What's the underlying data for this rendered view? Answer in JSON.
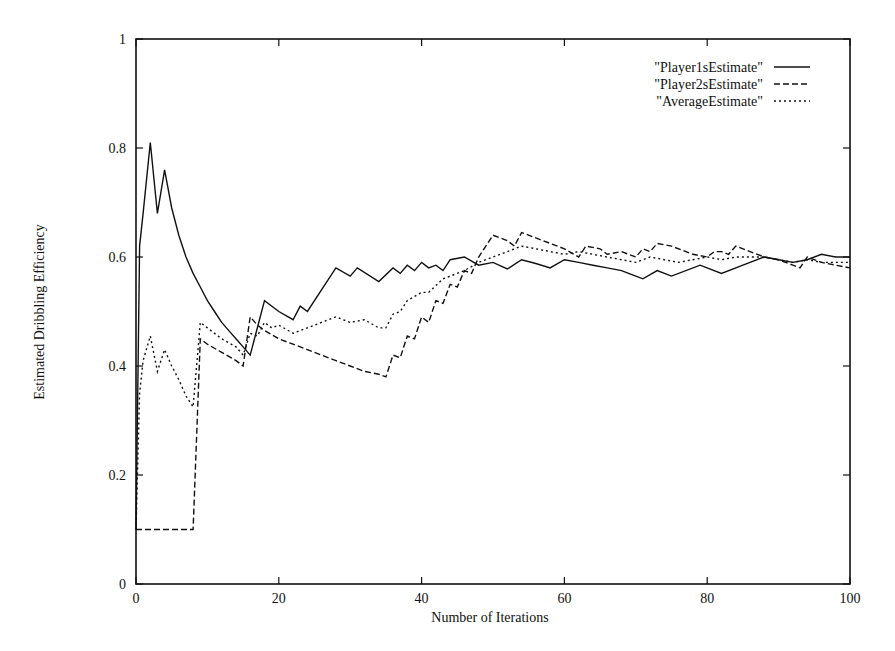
{
  "chart_data": {
    "type": "line",
    "title": "",
    "xlabel": "Number of Iterations",
    "ylabel": "Estimated Dribbling Efficiency",
    "xlim": [
      0,
      100
    ],
    "ylim": [
      0,
      1
    ],
    "xticks": [
      0,
      20,
      40,
      60,
      80,
      100
    ],
    "yticks": [
      0,
      0.2,
      0.4,
      0.6,
      0.8,
      1
    ],
    "xtick_labels": [
      "0",
      "20",
      "40",
      "60",
      "80",
      "100"
    ],
    "ytick_labels": [
      "0",
      "0.2",
      "0.4",
      "0.6",
      "0.8",
      "1"
    ],
    "grid": false,
    "legend_position": "top-right",
    "series": [
      {
        "name": "\"Player1sEstimate\"",
        "style": "solid",
        "points": [
          [
            0,
            0.1
          ],
          [
            0.5,
            0.62
          ],
          [
            1,
            0.68
          ],
          [
            2,
            0.81
          ],
          [
            3,
            0.68
          ],
          [
            4,
            0.76
          ],
          [
            5,
            0.69
          ],
          [
            6,
            0.64
          ],
          [
            7,
            0.6
          ],
          [
            8,
            0.57
          ],
          [
            9,
            0.545
          ],
          [
            10,
            0.52
          ],
          [
            11,
            0.5
          ],
          [
            12,
            0.48
          ],
          [
            13,
            0.465
          ],
          [
            14,
            0.45
          ],
          [
            15,
            0.435
          ],
          [
            16,
            0.42
          ],
          [
            18,
            0.52
          ],
          [
            20,
            0.5
          ],
          [
            22,
            0.485
          ],
          [
            23,
            0.51
          ],
          [
            24,
            0.5
          ],
          [
            28,
            0.58
          ],
          [
            30,
            0.565
          ],
          [
            31,
            0.58
          ],
          [
            34,
            0.555
          ],
          [
            36,
            0.58
          ],
          [
            37,
            0.57
          ],
          [
            38,
            0.585
          ],
          [
            39,
            0.575
          ],
          [
            40,
            0.59
          ],
          [
            41,
            0.58
          ],
          [
            42,
            0.585
          ],
          [
            43,
            0.575
          ],
          [
            44,
            0.595
          ],
          [
            46,
            0.6
          ],
          [
            48,
            0.585
          ],
          [
            50,
            0.59
          ],
          [
            52,
            0.578
          ],
          [
            54,
            0.595
          ],
          [
            56,
            0.588
          ],
          [
            58,
            0.58
          ],
          [
            60,
            0.595
          ],
          [
            62,
            0.59
          ],
          [
            64,
            0.585
          ],
          [
            66,
            0.58
          ],
          [
            68,
            0.575
          ],
          [
            70,
            0.565
          ],
          [
            71,
            0.56
          ],
          [
            73,
            0.575
          ],
          [
            75,
            0.565
          ],
          [
            79,
            0.585
          ],
          [
            82,
            0.57
          ],
          [
            85,
            0.585
          ],
          [
            88,
            0.6
          ],
          [
            90,
            0.595
          ],
          [
            92,
            0.59
          ],
          [
            94,
            0.595
          ],
          [
            96,
            0.605
          ],
          [
            98,
            0.6
          ],
          [
            100,
            0.6
          ]
        ]
      },
      {
        "name": "\"Player2sEstimate\"",
        "style": "dashed",
        "points": [
          [
            0,
            0.1
          ],
          [
            8,
            0.1
          ],
          [
            9,
            0.45
          ],
          [
            10,
            0.44
          ],
          [
            12,
            0.425
          ],
          [
            14,
            0.41
          ],
          [
            15,
            0.4
          ],
          [
            16,
            0.49
          ],
          [
            17,
            0.475
          ],
          [
            18,
            0.465
          ],
          [
            20,
            0.45
          ],
          [
            22,
            0.44
          ],
          [
            24,
            0.43
          ],
          [
            26,
            0.42
          ],
          [
            28,
            0.41
          ],
          [
            30,
            0.4
          ],
          [
            32,
            0.39
          ],
          [
            34,
            0.385
          ],
          [
            35,
            0.38
          ],
          [
            36,
            0.42
          ],
          [
            37,
            0.415
          ],
          [
            38,
            0.455
          ],
          [
            39,
            0.45
          ],
          [
            40,
            0.49
          ],
          [
            41,
            0.48
          ],
          [
            42,
            0.52
          ],
          [
            43,
            0.515
          ],
          [
            44,
            0.55
          ],
          [
            45,
            0.545
          ],
          [
            46,
            0.575
          ],
          [
            47,
            0.57
          ],
          [
            48,
            0.6
          ],
          [
            50,
            0.64
          ],
          [
            52,
            0.63
          ],
          [
            53,
            0.62
          ],
          [
            54,
            0.645
          ],
          [
            56,
            0.635
          ],
          [
            58,
            0.625
          ],
          [
            60,
            0.615
          ],
          [
            62,
            0.6
          ],
          [
            63,
            0.62
          ],
          [
            65,
            0.615
          ],
          [
            66,
            0.605
          ],
          [
            68,
            0.61
          ],
          [
            70,
            0.6
          ],
          [
            71,
            0.615
          ],
          [
            72,
            0.61
          ],
          [
            73,
            0.625
          ],
          [
            75,
            0.62
          ],
          [
            78,
            0.605
          ],
          [
            80,
            0.6
          ],
          [
            81,
            0.61
          ],
          [
            82,
            0.61
          ],
          [
            83,
            0.605
          ],
          [
            84,
            0.62
          ],
          [
            86,
            0.61
          ],
          [
            88,
            0.6
          ],
          [
            90,
            0.595
          ],
          [
            92,
            0.585
          ],
          [
            93,
            0.58
          ],
          [
            94,
            0.6
          ],
          [
            96,
            0.59
          ],
          [
            98,
            0.585
          ],
          [
            100,
            0.58
          ]
        ]
      },
      {
        "name": "\"AverageEstimate\"",
        "style": "dotted",
        "points": [
          [
            0,
            0.1
          ],
          [
            0.5,
            0.35
          ],
          [
            1,
            0.41
          ],
          [
            2,
            0.455
          ],
          [
            3,
            0.39
          ],
          [
            4,
            0.43
          ],
          [
            5,
            0.4
          ],
          [
            6,
            0.375
          ],
          [
            7,
            0.345
          ],
          [
            8,
            0.325
          ],
          [
            9,
            0.48
          ],
          [
            10,
            0.47
          ],
          [
            12,
            0.45
          ],
          [
            14,
            0.435
          ],
          [
            15,
            0.42
          ],
          [
            16,
            0.46
          ],
          [
            17,
            0.455
          ],
          [
            18,
            0.48
          ],
          [
            19,
            0.47
          ],
          [
            20,
            0.475
          ],
          [
            22,
            0.46
          ],
          [
            24,
            0.47
          ],
          [
            26,
            0.48
          ],
          [
            28,
            0.49
          ],
          [
            30,
            0.48
          ],
          [
            32,
            0.485
          ],
          [
            34,
            0.47
          ],
          [
            35,
            0.47
          ],
          [
            36,
            0.495
          ],
          [
            37,
            0.5
          ],
          [
            38,
            0.52
          ],
          [
            40,
            0.535
          ],
          [
            41,
            0.535
          ],
          [
            43,
            0.56
          ],
          [
            44,
            0.565
          ],
          [
            46,
            0.575
          ],
          [
            48,
            0.59
          ],
          [
            50,
            0.6
          ],
          [
            52,
            0.61
          ],
          [
            54,
            0.62
          ],
          [
            56,
            0.615
          ],
          [
            58,
            0.61
          ],
          [
            60,
            0.605
          ],
          [
            62,
            0.61
          ],
          [
            64,
            0.605
          ],
          [
            66,
            0.6
          ],
          [
            68,
            0.595
          ],
          [
            70,
            0.59
          ],
          [
            72,
            0.6
          ],
          [
            74,
            0.595
          ],
          [
            76,
            0.59
          ],
          [
            78,
            0.595
          ],
          [
            80,
            0.6
          ],
          [
            82,
            0.595
          ],
          [
            84,
            0.6
          ],
          [
            86,
            0.6
          ],
          [
            88,
            0.6
          ],
          [
            90,
            0.595
          ],
          [
            92,
            0.59
          ],
          [
            94,
            0.595
          ],
          [
            96,
            0.59
          ],
          [
            98,
            0.59
          ],
          [
            100,
            0.59
          ]
        ]
      }
    ]
  }
}
